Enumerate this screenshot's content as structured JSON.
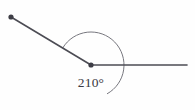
{
  "figure": {
    "kind": "geometry-diagram",
    "width": 195,
    "height": 110,
    "background_color": "#fefefe",
    "stroke_color": "#4c4c54",
    "arc_color": "#77777e",
    "dot_color": "#3d3d45",
    "text_color": "#3a3a42"
  },
  "vertex": {
    "name": "angle-vertex",
    "x": 91,
    "y": 65,
    "radius": 2.6,
    "has_dot": true
  },
  "rays": [
    {
      "name": "upper-left-ray",
      "from_x": 91,
      "from_y": 65,
      "to_x": 11,
      "to_y": 17,
      "endpoint_has_dot": true,
      "endpoint_radius": 2.6
    },
    {
      "name": "horizontal-right-ray",
      "from_x": 91,
      "from_y": 65,
      "to_x": 187,
      "to_y": 65,
      "endpoint_has_dot": false,
      "endpoint_radius": 0
    }
  ],
  "arc": {
    "name": "reflex-angle-arc",
    "center_x": 91,
    "center_y": 65,
    "radius": 33,
    "start_angle_deg": 149,
    "sweep_deg": 210,
    "direction": "clockwise-through-below",
    "path": "M 62.72 48.00 A 33 33 0 1 0 124 65"
  },
  "angle_label": {
    "name": "angle-measure-label",
    "value": 210,
    "unit": "°",
    "text": "210°",
    "x": 91,
    "y": 87
  }
}
